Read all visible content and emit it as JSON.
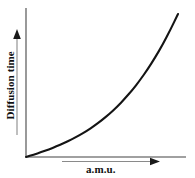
{
  "figure": {
    "background_color": "#ffffff",
    "axis_color": "#808080",
    "curve_color": "#141414",
    "label_color": "#111111"
  },
  "labels": {
    "y_axis": "Diffusion time",
    "x_axis": "a.m.u."
  },
  "icons": {
    "y_arrow": "arrow-up-icon",
    "x_arrow": "arrow-right-icon"
  },
  "chart_data": {
    "type": "line",
    "title": "",
    "xlabel": "a.m.u.",
    "ylabel": "Diffusion time",
    "grid": false,
    "legend": false,
    "xlim": [
      0,
      10
    ],
    "ylim": [
      0,
      10
    ],
    "axis_ticks": false,
    "annotation": "Diffusion time increases exponentially with atomic mass unit (a.m.u.)",
    "series": [
      {
        "name": "Diffusion time vs a.m.u.",
        "x": [
          0.0,
          0.5,
          1.0,
          1.5,
          2.0,
          2.5,
          3.0,
          3.5,
          4.0,
          4.5,
          5.0,
          5.5,
          6.0,
          6.5,
          7.0,
          7.5,
          8.0,
          8.5,
          9.0,
          9.5,
          10.0
        ],
        "y": [
          0.0,
          0.25,
          0.52,
          0.82,
          1.14,
          1.5,
          1.9,
          2.34,
          2.83,
          3.38,
          4.0,
          4.69,
          5.46,
          6.32,
          7.27,
          8.33,
          9.5,
          10.8,
          12.2,
          13.8,
          15.5
        ]
      }
    ]
  }
}
